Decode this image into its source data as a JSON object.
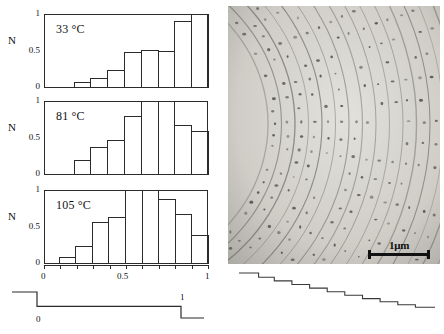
{
  "figure": {
    "panels_axis": {
      "y_label": "N",
      "y_ticks": [
        "0",
        "0.5",
        "1"
      ],
      "x_ticks_labeled": [
        "0",
        "0.5",
        "1"
      ]
    }
  },
  "chart_data": [
    {
      "type": "bar",
      "title": "33 °C",
      "temperature_value": "33",
      "temperature_unit": "°C",
      "xlabel": "",
      "ylabel": "N",
      "xlim": [
        0,
        1
      ],
      "ylim": [
        0,
        1
      ],
      "grid": false,
      "bin_edges": [
        0.0,
        0.1,
        0.2,
        0.3,
        0.4,
        0.5,
        0.6,
        0.7,
        0.8,
        0.9,
        1.0
      ],
      "categories": [
        "0.0-0.1",
        "0.1-0.2",
        "0.2-0.3",
        "0.3-0.4",
        "0.4-0.5",
        "0.5-0.6",
        "0.6-0.7",
        "0.7-0.8",
        "0.8-0.9",
        "0.9-1.0"
      ],
      "values": [
        0,
        0,
        0.08,
        0.14,
        0.25,
        0.48,
        0.52,
        0.5,
        0.9,
        1.0
      ]
    },
    {
      "type": "bar",
      "title": "81 °C",
      "temperature_value": "81",
      "temperature_unit": "°C",
      "xlabel": "",
      "ylabel": "N",
      "xlim": [
        0,
        1
      ],
      "ylim": [
        0,
        1
      ],
      "grid": false,
      "bin_edges": [
        0.0,
        0.1,
        0.2,
        0.3,
        0.4,
        0.5,
        0.6,
        0.7,
        0.8,
        0.9,
        1.0
      ],
      "categories": [
        "0.0-0.1",
        "0.1-0.2",
        "0.2-0.3",
        "0.3-0.4",
        "0.4-0.5",
        "0.5-0.6",
        "0.6-0.7",
        "0.7-0.8",
        "0.8-0.9",
        "0.9-1.0"
      ],
      "values": [
        0,
        0,
        0.2,
        0.38,
        0.47,
        0.8,
        1.0,
        1.0,
        0.68,
        0.6
      ]
    },
    {
      "type": "bar",
      "title": "105 °C",
      "temperature_value": "105",
      "temperature_unit": "°C",
      "xlabel": "",
      "ylabel": "N",
      "xlim": [
        0,
        1
      ],
      "ylim": [
        0,
        1
      ],
      "grid": false,
      "bin_edges": [
        0.0,
        0.1,
        0.2,
        0.3,
        0.4,
        0.5,
        0.6,
        0.7,
        0.8,
        0.9,
        1.0
      ],
      "categories": [
        "0.0-0.1",
        "0.1-0.2",
        "0.2-0.3",
        "0.3-0.4",
        "0.4-0.5",
        "0.5-0.6",
        "0.6-0.7",
        "0.7-0.8",
        "0.8-0.9",
        "0.9-1.0"
      ],
      "values": [
        0,
        0.1,
        0.25,
        0.57,
        0.64,
        1.0,
        1.0,
        0.88,
        0.67,
        0.39
      ]
    },
    {
      "type": "line",
      "name": "pulse-trace",
      "title": "",
      "annotations": [
        "0",
        "1"
      ],
      "x": [
        0.0,
        0.13,
        0.13,
        0.88,
        0.88,
        1.0
      ],
      "y": [
        1.0,
        1.0,
        0.45,
        0.45,
        0.0,
        0.0
      ]
    },
    {
      "type": "line",
      "name": "staircase-trace",
      "title": "",
      "x": [
        0.0,
        0.1,
        0.1,
        0.18,
        0.18,
        0.27,
        0.27,
        0.36,
        0.36,
        0.45,
        0.45,
        0.54,
        0.54,
        0.63,
        0.63,
        0.72,
        0.72,
        0.81,
        0.81,
        0.9,
        0.9,
        1.0
      ],
      "y": [
        1.0,
        1.0,
        0.88,
        0.88,
        0.78,
        0.78,
        0.68,
        0.68,
        0.58,
        0.58,
        0.48,
        0.48,
        0.38,
        0.38,
        0.29,
        0.29,
        0.2,
        0.2,
        0.12,
        0.12,
        0.05,
        0.05
      ]
    }
  ],
  "micrograph": {
    "scalebar_label": "1μm",
    "caption": ""
  }
}
